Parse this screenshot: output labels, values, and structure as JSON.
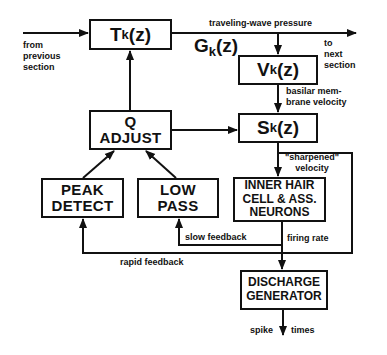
{
  "blocks": {
    "tk": {
      "main": "T",
      "sub": "k",
      "arg": "(z)"
    },
    "vk": {
      "main": "V",
      "sub": "k",
      "arg": "(z)"
    },
    "sk": {
      "main": "S",
      "sub": "k",
      "arg": "(z)"
    },
    "q_adjust": {
      "line1": "Q",
      "line2": "ADJUST"
    },
    "peak_detect": {
      "line1": "PEAK",
      "line2": "DETECT"
    },
    "low_pass": {
      "line1": "LOW",
      "line2": "PASS"
    },
    "inner_hair_cell": {
      "line1": "INNER HAIR",
      "line2": "CELL  & ASS.",
      "line3": "NEURONS"
    },
    "discharge_generator": {
      "line1": "DISCHARGE",
      "line2": "GENERATOR"
    }
  },
  "labels": {
    "gk": {
      "main": "G",
      "sub": "k",
      "arg": "(z)"
    },
    "from_previous": {
      "line1": "from",
      "line2": "previous",
      "line3": "section"
    },
    "to_next": {
      "line1": "to",
      "line2": "next",
      "line3": "section"
    },
    "traveling_wave": "traveling-wave pressure",
    "basilar": {
      "line1": "basilar mem-",
      "line2": "brane velocity"
    },
    "sharpened": {
      "line1": "\"sharpened\"",
      "line2": "velocity"
    },
    "slow_feedback": "slow feedback",
    "firing_rate": "firing rate",
    "rapid_feedback": "rapid feedback",
    "spike": "spike",
    "times": "times"
  }
}
